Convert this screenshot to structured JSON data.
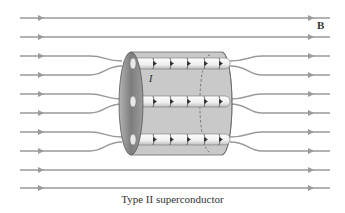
{
  "diagram": {
    "title": "Type II superconductor",
    "field_label": "B",
    "current_label": "I",
    "field_lines": {
      "count": 10,
      "color": "#9a9a9a",
      "straight_top_y": [
        18,
        37
      ],
      "straight_bottom_y": [
        170,
        188
      ],
      "pinched_pairs": [
        {
          "outer_top_y": 56,
          "outer_bottom_y": 75,
          "core_y": 63
        },
        {
          "outer_top_y": 94,
          "outer_bottom_y": 113,
          "core_y": 101
        },
        {
          "outer_top_y": 132,
          "outer_bottom_y": 151,
          "core_y": 139
        }
      ]
    },
    "cylinder": {
      "fill": "#c8c8c8",
      "end_face_fill": "#8f8f8f",
      "vortex_count": 3,
      "vortex_fill": "#f2f2f2"
    }
  }
}
